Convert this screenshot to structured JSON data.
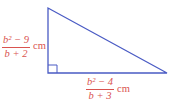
{
  "diagram": {
    "shape": "right triangle",
    "stroke_color": "#4a5bc4",
    "label_color": "#d9534f",
    "vertical_leg": {
      "numerator": "b² − 9",
      "denominator": "b + 2",
      "unit": "cm"
    },
    "horizontal_leg": {
      "numerator": "b² − 4",
      "denominator": "b + 3",
      "unit": "cm"
    },
    "right_angle_marker": true
  }
}
